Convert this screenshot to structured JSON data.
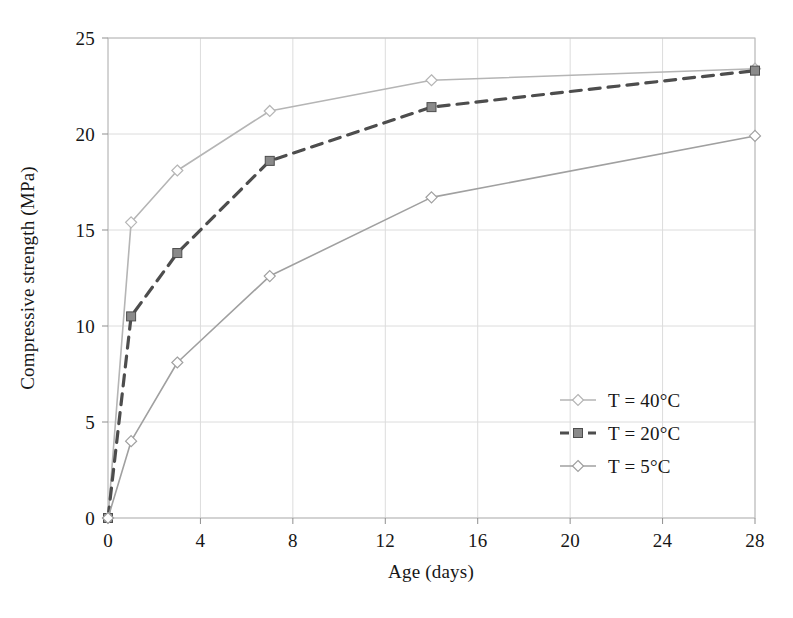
{
  "chart_data": {
    "type": "line",
    "title": "",
    "xlabel": "Age (days)",
    "ylabel": "Compressive strength (MPa)",
    "xlim": [
      0,
      28
    ],
    "ylim": [
      0,
      25
    ],
    "xticks": [
      0,
      4,
      8,
      12,
      16,
      20,
      24,
      28
    ],
    "yticks": [
      0,
      5,
      10,
      15,
      20,
      25
    ],
    "xtick_labels": [
      "0",
      "4",
      "8",
      "12",
      "16",
      "20",
      "24",
      "28"
    ],
    "ytick_labels": [
      "0",
      "5",
      "10",
      "15",
      "20",
      "25"
    ],
    "grid": true,
    "legend_position": "right-inside-lower",
    "x": [
      0,
      1,
      3,
      7,
      14,
      28
    ],
    "series": [
      {
        "name": "T = 40°C",
        "label": "T = 40°C",
        "color": "#b5b5b5",
        "marker": "diamond",
        "marker_fill": "#d8d8d8",
        "dash": "none",
        "values": [
          0,
          15.4,
          18.1,
          21.2,
          22.8,
          23.4
        ]
      },
      {
        "name": "T = 20°C",
        "label": "T = 20°C",
        "color": "#4d4d4d",
        "marker": "square",
        "marker_fill": "#8a8a8a",
        "dash": "dashed",
        "values": [
          0,
          10.5,
          13.8,
          18.6,
          21.4,
          23.3
        ]
      },
      {
        "name": "T = 5°C",
        "label": "T = 5°C",
        "color": "#a0a0a0",
        "marker": "diamond",
        "marker_fill": "#cccccc",
        "dash": "none",
        "values": [
          0,
          4.0,
          8.1,
          12.6,
          16.7,
          19.9
        ]
      }
    ],
    "colors": {
      "grid": "#dcdcdc",
      "axis": "#8f8f8f",
      "text": "#161616",
      "background": "#ffffff"
    }
  }
}
